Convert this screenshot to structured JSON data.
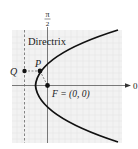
{
  "figure": {
    "type": "polar-parabola-diagram",
    "axis_labels": {
      "vertical_numerator": "π",
      "vertical_denominator": "2",
      "horizontal": "0"
    },
    "directrix_label": "Directrix",
    "points": {
      "P": {
        "label": "P"
      },
      "Q": {
        "label": "Q"
      },
      "F": {
        "label": "F = (0, 0)"
      }
    },
    "colors": {
      "curve": "#111111",
      "grid_bg": "#f2f2f2",
      "grid_line": "#e2e2e2",
      "axis": "#333333"
    }
  }
}
